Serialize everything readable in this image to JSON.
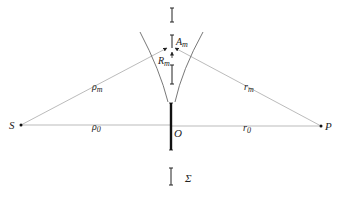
{
  "diagram": {
    "type": "fresnel-zone-geometry",
    "colors": {
      "ray": "#aaaaaa",
      "ink": "#222222",
      "curve": "#555555"
    },
    "points": {
      "source": {
        "label": "S",
        "x": 21,
        "y": 125
      },
      "observer": {
        "label": "P",
        "x": 321,
        "y": 126
      },
      "origin": {
        "label": "O",
        "x": 171,
        "y": 125
      }
    },
    "labels": {
      "rho_m": {
        "main": "ρ",
        "sub": "m"
      },
      "r_m": {
        "main": "r",
        "sub": "m"
      },
      "rho_0": {
        "main": "ρ",
        "sub": "0"
      },
      "r_0": {
        "main": "r",
        "sub": "0"
      },
      "A_m": {
        "main": "A",
        "sub": "m"
      },
      "R_m": {
        "main": "R",
        "sub": "m"
      },
      "O": "O",
      "S": "S",
      "P": "P",
      "Sigma": "Σ"
    }
  }
}
